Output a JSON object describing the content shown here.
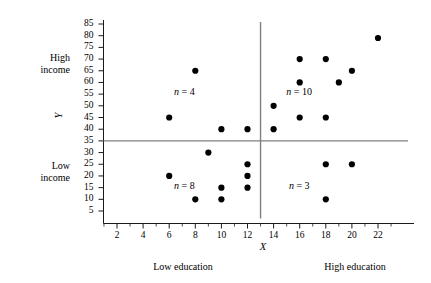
{
  "chart_data": {
    "type": "scatter",
    "title": "",
    "xlabel": "X",
    "ylabel": "Y",
    "xlim": [
      1,
      23
    ],
    "ylim": [
      0,
      87
    ],
    "grid": false,
    "legend": "none",
    "xticks": [
      2,
      4,
      6,
      8,
      10,
      12,
      14,
      16,
      18,
      20,
      22
    ],
    "yticks": [
      5,
      10,
      15,
      20,
      25,
      30,
      35,
      40,
      45,
      50,
      55,
      60,
      65,
      70,
      75,
      80,
      85
    ],
    "minor_xticks": [
      1,
      3,
      5,
      7,
      9,
      11,
      13,
      15,
      17,
      19,
      21,
      23
    ],
    "reference_lines": {
      "horizontal_y": 35,
      "vertical_x": 13
    },
    "quadrant_labels": [
      {
        "text": "n = 4",
        "n": 4,
        "x": 7.6,
        "y": 55,
        "quadrant": "upper-left"
      },
      {
        "text": "n = 8",
        "n": 8,
        "x": 7.6,
        "y": 15,
        "quadrant": "lower-left"
      },
      {
        "text": "n = 10",
        "n": 10,
        "x": 16.2,
        "y": 55,
        "quadrant": "upper-right"
      },
      {
        "text": "n = 3",
        "n": 3,
        "x": 16.4,
        "y": 15,
        "quadrant": "lower-right"
      }
    ],
    "axis_side_labels": {
      "high_income": "High\nincome",
      "low_income": "Low\nincome",
      "low_education": "Low education",
      "high_education": "High education"
    },
    "points": [
      {
        "x": 6,
        "y": 45,
        "quadrant": "upper-left"
      },
      {
        "x": 8,
        "y": 65,
        "quadrant": "upper-left"
      },
      {
        "x": 10,
        "y": 40,
        "quadrant": "upper-left"
      },
      {
        "x": 12,
        "y": 40,
        "quadrant": "upper-left"
      },
      {
        "x": 6,
        "y": 20,
        "quadrant": "lower-left"
      },
      {
        "x": 8,
        "y": 10,
        "quadrant": "lower-left"
      },
      {
        "x": 9,
        "y": 30,
        "quadrant": "lower-left"
      },
      {
        "x": 10,
        "y": 15,
        "quadrant": "lower-left"
      },
      {
        "x": 10,
        "y": 10,
        "quadrant": "lower-left"
      },
      {
        "x": 12,
        "y": 25,
        "quadrant": "lower-left"
      },
      {
        "x": 12,
        "y": 20,
        "quadrant": "lower-left"
      },
      {
        "x": 12,
        "y": 15,
        "quadrant": "lower-left"
      },
      {
        "x": 14,
        "y": 50,
        "quadrant": "upper-right"
      },
      {
        "x": 14,
        "y": 40,
        "quadrant": "upper-right"
      },
      {
        "x": 16,
        "y": 70,
        "quadrant": "upper-right"
      },
      {
        "x": 16,
        "y": 60,
        "quadrant": "upper-right"
      },
      {
        "x": 16,
        "y": 45,
        "quadrant": "upper-right"
      },
      {
        "x": 18,
        "y": 70,
        "quadrant": "upper-right"
      },
      {
        "x": 18,
        "y": 45,
        "quadrant": "upper-right"
      },
      {
        "x": 19,
        "y": 60,
        "quadrant": "upper-right"
      },
      {
        "x": 20,
        "y": 65,
        "quadrant": "upper-right"
      },
      {
        "x": 22,
        "y": 79,
        "quadrant": "upper-right"
      },
      {
        "x": 18,
        "y": 25,
        "quadrant": "lower-right"
      },
      {
        "x": 18,
        "y": 10,
        "quadrant": "lower-right"
      },
      {
        "x": 20,
        "y": 25,
        "quadrant": "lower-right"
      }
    ],
    "colors": {
      "point": "#000000",
      "axis": "#1a1a1a",
      "reference_line": "#808080",
      "background": "#ffffff"
    }
  }
}
